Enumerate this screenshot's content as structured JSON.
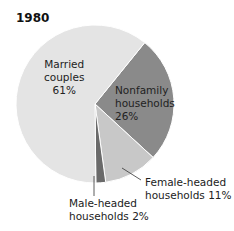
{
  "chart_data": {
    "type": "pie",
    "title": "1980",
    "categories": [
      "Married couples",
      "Nonfamily households",
      "Female-headed households",
      "Male-headed households"
    ],
    "values": [
      61,
      26,
      11,
      2
    ],
    "unit": "%",
    "colors": [
      "#e4e4e4",
      "#8a8a8a",
      "#c8c8c8",
      "#6a6a6a"
    ],
    "start_angle_deg": 39,
    "labels": [
      {
        "line1": "Married",
        "line2": "couples",
        "line3": "61%"
      },
      {
        "line1": "Nonfamily",
        "line2": "households",
        "line3": "26%"
      },
      {
        "line1": "Female-headed",
        "line2": "households 11%"
      },
      {
        "line1": "Male-headed",
        "line2": "households 2%"
      }
    ]
  }
}
